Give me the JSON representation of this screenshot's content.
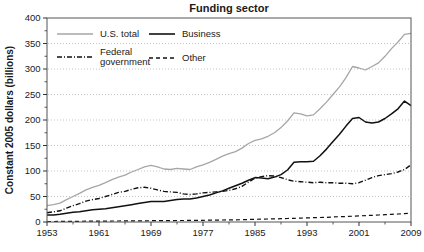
{
  "chart_data": {
    "type": "line",
    "title": "Funding sector",
    "xlabel": "",
    "ylabel": "Constant 2005 dollars (billions)",
    "xlim": [
      1953,
      2009
    ],
    "ylim": [
      0,
      400
    ],
    "yticks": [
      0,
      50,
      100,
      150,
      200,
      250,
      300,
      350,
      400
    ],
    "ytick_minor_step": 25,
    "xticks": [
      1953,
      1961,
      1969,
      1977,
      1985,
      1993,
      2001,
      2009
    ],
    "xticks_minor": [
      1957,
      1965,
      1973,
      1981,
      1989,
      1997,
      2005
    ],
    "grid": "dotted horizontal gridlines at 50-350, full box frame",
    "legend_position": "top-left inside plot, two columns",
    "years": [
      1953,
      1954,
      1955,
      1956,
      1957,
      1958,
      1959,
      1960,
      1961,
      1962,
      1963,
      1964,
      1965,
      1966,
      1967,
      1968,
      1969,
      1970,
      1971,
      1972,
      1973,
      1974,
      1975,
      1976,
      1977,
      1978,
      1979,
      1980,
      1981,
      1982,
      1983,
      1984,
      1985,
      1986,
      1987,
      1988,
      1989,
      1990,
      1991,
      1992,
      1993,
      1994,
      1995,
      1996,
      1997,
      1998,
      1999,
      2000,
      2001,
      2002,
      2003,
      2004,
      2005,
      2006,
      2007,
      2008,
      2009
    ],
    "series": [
      {
        "name": "U.S. total",
        "color": "#a6a6a6",
        "dash": "",
        "width": 1.3,
        "values": [
          32,
          34,
          37,
          44,
          50,
          56,
          63,
          68,
          72,
          77,
          83,
          88,
          92,
          98,
          103,
          108,
          111,
          108,
          104,
          103,
          105,
          104,
          103,
          108,
          112,
          117,
          123,
          129,
          134,
          138,
          145,
          154,
          160,
          163,
          168,
          175,
          185,
          198,
          214,
          212,
          208,
          210,
          222,
          235,
          250,
          265,
          283,
          305,
          302,
          298,
          305,
          312,
          325,
          340,
          353,
          368,
          370
        ]
      },
      {
        "name": "Business",
        "color": "#111111",
        "dash": "",
        "width": 1.5,
        "values": [
          14,
          14,
          15,
          17,
          19,
          20,
          22,
          24,
          25,
          26,
          28,
          30,
          32,
          34,
          36,
          38,
          40,
          40,
          40,
          42,
          44,
          45,
          45,
          47,
          50,
          53,
          57,
          61,
          66,
          71,
          76,
          82,
          87,
          86,
          85,
          88,
          93,
          102,
          117,
          118,
          118,
          119,
          130,
          143,
          158,
          172,
          188,
          203,
          205,
          196,
          194,
          196,
          203,
          212,
          222,
          237,
          228
        ]
      },
      {
        "name": "Federal government",
        "color": "#111111",
        "dash": "5 2 1 2",
        "width": 1.4,
        "values": [
          18,
          20,
          22,
          27,
          32,
          36,
          41,
          44,
          46,
          50,
          54,
          58,
          60,
          64,
          67,
          68,
          66,
          63,
          60,
          59,
          58,
          55,
          54,
          55,
          57,
          58,
          59,
          60,
          62,
          65,
          70,
          78,
          86,
          89,
          91,
          90,
          87,
          83,
          80,
          79,
          78,
          77,
          78,
          77,
          77,
          76,
          76,
          75,
          77,
          82,
          87,
          91,
          93,
          95,
          98,
          103,
          112
        ]
      },
      {
        "name": "Other",
        "color": "#111111",
        "dash": "4 3",
        "width": 1.2,
        "values": [
          1,
          1,
          1.1,
          1.2,
          1.3,
          1.4,
          1.5,
          1.6,
          1.7,
          1.8,
          1.9,
          2,
          2.1,
          2.2,
          2.3,
          2.4,
          2.5,
          2.6,
          2.7,
          2.8,
          2.9,
          3,
          3.1,
          3.2,
          3.3,
          3.5,
          3.7,
          3.9,
          4.1,
          4.3,
          4.6,
          4.9,
          5.2,
          5.5,
          5.8,
          6.1,
          6.5,
          6.9,
          7.3,
          7.7,
          8.1,
          8.5,
          8.9,
          9.3,
          9.8,
          10.3,
          10.8,
          11.3,
          11.9,
          12.5,
          13.1,
          13.7,
          14.3,
          15,
          15.7,
          16.4,
          17.2
        ]
      }
    ],
    "frame_color": "#555555",
    "grid_color": "#b5b5b5",
    "tick_color": "#333333",
    "text_color": "#1a1a1a"
  }
}
